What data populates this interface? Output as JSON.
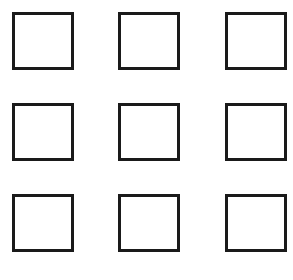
{
  "diagram": {
    "type": "grid-of-squares",
    "rows": 3,
    "columns": 3,
    "square_count": 9,
    "stroke_color": "#1a1a1a",
    "fill_color": "#ffffff",
    "background_color": "#ffffff",
    "squares": [
      {
        "row": 1,
        "col": 1,
        "x": 12,
        "y": 12
      },
      {
        "row": 1,
        "col": 2,
        "x": 118,
        "y": 12
      },
      {
        "row": 1,
        "col": 3,
        "x": 225,
        "y": 12
      },
      {
        "row": 2,
        "col": 1,
        "x": 12,
        "y": 103
      },
      {
        "row": 2,
        "col": 2,
        "x": 118,
        "y": 103
      },
      {
        "row": 2,
        "col": 3,
        "x": 225,
        "y": 103
      },
      {
        "row": 3,
        "col": 1,
        "x": 12,
        "y": 194
      },
      {
        "row": 3,
        "col": 2,
        "x": 118,
        "y": 194
      },
      {
        "row": 3,
        "col": 3,
        "x": 225,
        "y": 194
      }
    ]
  }
}
